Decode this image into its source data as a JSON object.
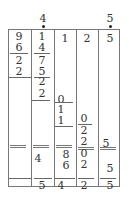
{
  "top_digits": [
    {
      "value": "4",
      "x": 38,
      "y": 13
    },
    {
      "value": "5",
      "x": 105,
      "y": 13
    }
  ],
  "columns": [
    {
      "digits": [
        {
          "v": "9",
          "x": 14,
          "y": 31
        },
        {
          "v": "6",
          "x": 14,
          "y": 42
        },
        {
          "v": "2",
          "x": 14,
          "y": 55
        },
        {
          "v": "2",
          "x": 14,
          "y": 66
        }
      ]
    },
    {
      "digits": [
        {
          "v": "1",
          "x": 37,
          "y": 31
        },
        {
          "v": "4",
          "x": 37,
          "y": 42
        },
        {
          "v": "7",
          "x": 37,
          "y": 55
        },
        {
          "v": "5",
          "x": 37,
          "y": 66
        },
        {
          "v": "2",
          "x": 37,
          "y": 76
        },
        {
          "v": "2",
          "x": 37,
          "y": 88
        },
        {
          "v": "4",
          "x": 33,
          "y": 153
        },
        {
          "v": "5",
          "x": 37,
          "y": 180
        }
      ]
    },
    {
      "digits": [
        {
          "v": "1",
          "x": 60,
          "y": 33
        },
        {
          "v": "0",
          "x": 56,
          "y": 94
        },
        {
          "v": "1",
          "x": 56,
          "y": 104
        },
        {
          "v": "1",
          "x": 56,
          "y": 115
        },
        {
          "v": "8",
          "x": 61,
          "y": 149
        },
        {
          "v": "6",
          "x": 61,
          "y": 160
        },
        {
          "v": "4",
          "x": 56,
          "y": 180
        }
      ]
    },
    {
      "digits": [
        {
          "v": "2",
          "x": 82,
          "y": 33
        },
        {
          "v": "0",
          "x": 79,
          "y": 113
        },
        {
          "v": "2",
          "x": 79,
          "y": 125
        },
        {
          "v": "2",
          "x": 79,
          "y": 136
        },
        {
          "v": "0",
          "x": 79,
          "y": 148
        },
        {
          "v": "2",
          "x": 79,
          "y": 159
        },
        {
          "v": "2",
          "x": 79,
          "y": 180
        }
      ]
    },
    {
      "digits": [
        {
          "v": "5",
          "x": 105,
          "y": 33
        },
        {
          "v": "5",
          "x": 101,
          "y": 138
        },
        {
          "v": "5",
          "x": 105,
          "y": 163
        },
        {
          "v": "5",
          "x": 105,
          "y": 180
        }
      ]
    }
  ]
}
